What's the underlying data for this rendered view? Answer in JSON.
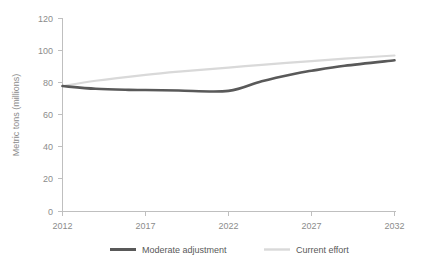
{
  "chart_data": {
    "type": "line",
    "title": "",
    "subtitle": "",
    "xlabel": "",
    "ylabel": "Metric tons (millions)",
    "x": [
      2012,
      2017,
      2022,
      2027,
      2032
    ],
    "xlim": [
      2012,
      2032
    ],
    "ylim": [
      0,
      120
    ],
    "x_ticks": [
      "2012",
      "2017",
      "2022",
      "2027",
      "2032"
    ],
    "y_ticks": [
      "0",
      "20",
      "40",
      "60",
      "80",
      "100",
      "120"
    ],
    "grid": false,
    "legend_position": "bottom",
    "series": [
      {
        "name": "Moderate adjustment",
        "color": "#595959",
        "width": 2.6,
        "values": [
          78,
          75.5,
          75,
          87.5,
          94
        ],
        "points": [
          {
            "x": 2012,
            "y": 78
          },
          {
            "x": 2014,
            "y": 76.3
          },
          {
            "x": 2016,
            "y": 75.6
          },
          {
            "x": 2017,
            "y": 75.5
          },
          {
            "x": 2019,
            "y": 75.2
          },
          {
            "x": 2022,
            "y": 75
          },
          {
            "x": 2024,
            "y": 81
          },
          {
            "x": 2026,
            "y": 85.7
          },
          {
            "x": 2027,
            "y": 87.5
          },
          {
            "x": 2029,
            "y": 90.6
          },
          {
            "x": 2032,
            "y": 94
          }
        ]
      },
      {
        "name": "Current effort",
        "color": "#d9d9d9",
        "width": 2.2,
        "values": [
          78,
          85,
          89.5,
          93.5,
          97
        ],
        "points": [
          {
            "x": 2012,
            "y": 78
          },
          {
            "x": 2014,
            "y": 81.3
          },
          {
            "x": 2017,
            "y": 85
          },
          {
            "x": 2019,
            "y": 87
          },
          {
            "x": 2022,
            "y": 89.5
          },
          {
            "x": 2024,
            "y": 91.2
          },
          {
            "x": 2027,
            "y": 93.5
          },
          {
            "x": 2029,
            "y": 95
          },
          {
            "x": 2032,
            "y": 97
          }
        ]
      }
    ]
  },
  "axes": {
    "y_title": "Metric tons (millions)",
    "y_tick_labels": [
      "120",
      "100",
      "80",
      "60",
      "40",
      "20",
      "0"
    ],
    "x_tick_labels": [
      "2012",
      "2017",
      "2022",
      "2027",
      "2032"
    ]
  },
  "legend": {
    "entries": [
      {
        "label": "Moderate adjustment",
        "color": "#595959"
      },
      {
        "label": "Current effort",
        "color": "#d9d9d9"
      }
    ]
  },
  "colors": {
    "background": "#ffffff",
    "axis": "#bfbfbf",
    "tick_text": "#8c8c8c",
    "legend_text": "#595959",
    "series_moderate": "#595959",
    "series_current": "#d9d9d9"
  }
}
